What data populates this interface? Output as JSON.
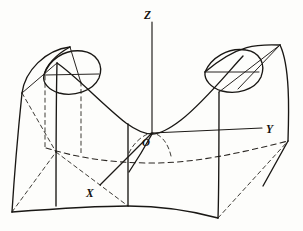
{
  "figure": {
    "kind": "3d-surface-diagram",
    "background_color": "#fdfdfb",
    "ink_color": "#191714"
  },
  "axes": [
    {
      "id": "z",
      "label": "Z",
      "label_x": 145,
      "label_y": 18,
      "line": "M152,133 L152,22",
      "direction": "up"
    },
    {
      "id": "y",
      "label": "Y",
      "label_x": 268,
      "label_y": 132,
      "line": "M152,133 L262,128",
      "direction": "right"
    },
    {
      "id": "x",
      "label": "X",
      "label_x": 88,
      "label_y": 195,
      "line": "M152,133 L101,184",
      "direction": "front-left"
    }
  ],
  "origin": {
    "label": "O",
    "label_x": 143,
    "label_y": 144,
    "point_x": 152,
    "point_y": 133
  },
  "surface": {
    "type": "elliptic-paraboloid",
    "equation_form": "z = a*x^2 + b*y^2",
    "valley_bottom": "origin",
    "peaks": [
      "left-rear",
      "right-rear"
    ],
    "front_bottom_edge": "M12,212 Q70,210 128,206 Q175,210 218,218",
    "left_peak_apex_x": 70,
    "left_peak_apex_y": 48,
    "right_peak_apex_x": 280,
    "right_peak_apex_y": 45
  },
  "paths": {
    "valley_front_profile": "M58,64 C78,78 104,106 127,124 C139,132 146,134 152,134 C159,134 167,131 180,121 C203,104 227,74 242,57",
    "left_rim_ellipse": "M44,75 C52,61 66,50 82,52 C97,54 103,66 98,78 C92,90 74,96 60,92 C50,89 43,83 44,75",
    "right_rim_ellipse": "M206,72 C212,59 228,49 245,51 C259,53 265,64 260,76 C254,88 236,94 222,90 C212,87 205,80 206,72",
    "left_ridge": "M70,48 L80,82",
    "right_ridge": "M280,45 L238,88",
    "left_outer_wall": "M22,93 C26,72 46,52 70,48",
    "right_outer_wall": "M280,45 C292,62 289,112 288,140",
    "left_vertical_front": "M22,93 C18,135 14,180 12,212",
    "left_inner_vertical": "M58,64 C56,100 56,150 56,206",
    "center_vertical": "M128,124 L128,206",
    "right_inner_vertical": "M218,96 C218,140 218,190 218,218",
    "right_outer_vertical": "M288,140 L262,186",
    "top_left_horizontal": "M44,75 L98,75",
    "top_right_horizontal": "M206,73 L258,73",
    "base_quad_left": "M12,212 L56,152",
    "base_quad_left2": "M56,152 L22,93",
    "base_front_right": "M218,218 L288,140",
    "back_dashed_contour": "M46,148 C90,160 140,163 196,156 C232,151 262,144 288,140",
    "dashed_left_vertical": "M45,78 L45,148",
    "dashed_left_inner": "M80,82 L80,148",
    "dashed_origin_arc": "M128,152 C136,140 146,134 152,133 C160,133 167,142 170,154",
    "dashed_base_left": "M12,212 L56,152",
    "dashed_base_center": "M56,152 L128,206",
    "dashed_y_back": "M152,133 L288,140",
    "small_solid_arc": "M152,134 C147,142 138,155 128,168"
  },
  "labels": {
    "z": "Z",
    "y": "Y",
    "x": "X",
    "origin": "O"
  }
}
